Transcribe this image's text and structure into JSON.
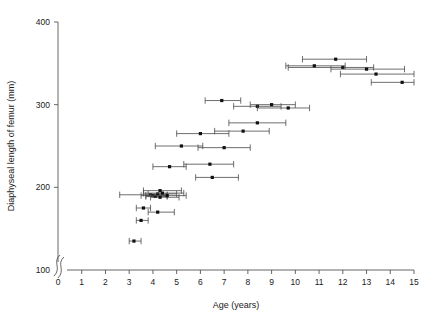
{
  "chart_data": {
    "type": "scatter",
    "title": "",
    "xlabel": "Age (years)",
    "ylabel": "Diaphyseal length of femur (mm)",
    "xlim": [
      0,
      15
    ],
    "ylim": [
      100,
      400
    ],
    "xticks": [
      0,
      1,
      2,
      3,
      4,
      5,
      6,
      7,
      8,
      9,
      10,
      11,
      12,
      13,
      14,
      15
    ],
    "yticks": [
      100,
      200,
      300,
      400
    ],
    "xtick_labels": [
      "0",
      "1",
      "2",
      "3",
      "4",
      "5",
      "6",
      "7",
      "8",
      "9",
      "10",
      "11",
      "12",
      "13",
      "14",
      "15"
    ],
    "ytick_labels": [
      "100",
      "200",
      "300",
      "400"
    ],
    "grid": false,
    "legend": null,
    "axis_break": {
      "axis": "both",
      "location": "origin",
      "note": "y-axis broken below 100"
    },
    "error_bars": "horizontal (age range)",
    "marker": "filled square",
    "points": [
      {
        "x": 3.2,
        "y": 135,
        "xlo": 3.0,
        "xhi": 3.5
      },
      {
        "x": 3.5,
        "y": 160,
        "xlo": 3.3,
        "xhi": 3.8
      },
      {
        "x": 3.6,
        "y": 175,
        "xlo": 3.3,
        "xhi": 3.9
      },
      {
        "x": 4.2,
        "y": 170,
        "xlo": 3.8,
        "xhi": 4.9
      },
      {
        "x": 3.9,
        "y": 191,
        "xlo": 2.6,
        "xhi": 4.6
      },
      {
        "x": 4.0,
        "y": 190,
        "xlo": 3.5,
        "xhi": 4.6
      },
      {
        "x": 4.1,
        "y": 189,
        "xlo": 3.7,
        "xhi": 4.6
      },
      {
        "x": 4.2,
        "y": 192,
        "xlo": 3.8,
        "xhi": 5.0
      },
      {
        "x": 4.3,
        "y": 188,
        "xlo": 3.9,
        "xhi": 5.1
      },
      {
        "x": 4.4,
        "y": 193,
        "xlo": 3.6,
        "xhi": 5.3
      },
      {
        "x": 4.6,
        "y": 190,
        "xlo": 3.7,
        "xhi": 5.4
      },
      {
        "x": 4.3,
        "y": 196,
        "xlo": 3.6,
        "xhi": 5.2
      },
      {
        "x": 4.7,
        "y": 225,
        "xlo": 4.0,
        "xhi": 5.4
      },
      {
        "x": 6.4,
        "y": 228,
        "xlo": 5.3,
        "xhi": 7.4
      },
      {
        "x": 5.2,
        "y": 250,
        "xlo": 4.1,
        "xhi": 6.1
      },
      {
        "x": 6.5,
        "y": 212,
        "xlo": 5.8,
        "xhi": 7.6
      },
      {
        "x": 7.0,
        "y": 248,
        "xlo": 5.9,
        "xhi": 8.1
      },
      {
        "x": 6.0,
        "y": 265,
        "xlo": 5.0,
        "xhi": 7.2
      },
      {
        "x": 7.8,
        "y": 268,
        "xlo": 6.6,
        "xhi": 8.9
      },
      {
        "x": 8.4,
        "y": 278,
        "xlo": 7.2,
        "xhi": 9.6
      },
      {
        "x": 6.9,
        "y": 305,
        "xlo": 6.2,
        "xhi": 7.7
      },
      {
        "x": 8.4,
        "y": 298,
        "xlo": 7.4,
        "xhi": 9.4
      },
      {
        "x": 9.0,
        "y": 300,
        "xlo": 8.1,
        "xhi": 10.0
      },
      {
        "x": 9.7,
        "y": 296,
        "xlo": 8.4,
        "xhi": 10.6
      },
      {
        "x": 11.7,
        "y": 355,
        "xlo": 10.3,
        "xhi": 13.0
      },
      {
        "x": 12.0,
        "y": 345,
        "xlo": 9.7,
        "xhi": 13.3
      },
      {
        "x": 13.0,
        "y": 343,
        "xlo": 11.5,
        "xhi": 14.6
      },
      {
        "x": 13.4,
        "y": 337,
        "xlo": 11.9,
        "xhi": 15.0
      },
      {
        "x": 14.5,
        "y": 327,
        "xlo": 13.2,
        "xhi": 15.0
      },
      {
        "x": 10.8,
        "y": 347,
        "xlo": 9.6,
        "xhi": 12.1
      }
    ]
  }
}
